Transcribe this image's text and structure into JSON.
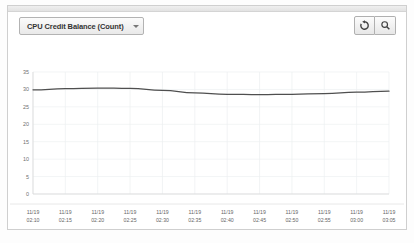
{
  "panel": {
    "metric_selector": {
      "label": "CPU Credit Balance (Count)",
      "caret_icon": "chevron-down-icon"
    },
    "buttons": [
      {
        "name": "refresh-button",
        "icon": "refresh-icon",
        "title": "Refresh"
      },
      {
        "name": "zoom-button",
        "icon": "magnifier-icon",
        "title": "Zoom"
      }
    ]
  },
  "chart_data": {
    "type": "line",
    "title": "CPU Credit Balance (Count)",
    "xlabel": "",
    "ylabel": "",
    "grid": true,
    "legend": "none",
    "ylim": [
      0,
      35
    ],
    "yticks": [
      "0",
      "5",
      "10",
      "15",
      "20",
      "25",
      "30",
      "35"
    ],
    "ytick_values": [
      0,
      5,
      10,
      15,
      20,
      25,
      30,
      35
    ],
    "categories": [
      "11/19\n02:10",
      "11/19\n02:15",
      "11/19\n02:20",
      "11/19\n02:25",
      "11/19\n02:30",
      "11/19\n02:35",
      "11/19\n02:40",
      "11/19\n02:45",
      "11/19\n02:50",
      "11/19\n02:55",
      "11/19\n03:00",
      "11/19\n03:05"
    ],
    "xtick_dates": [
      "11/19",
      "11/19",
      "11/19",
      "11/19",
      "11/19",
      "11/19",
      "11/19",
      "11/19",
      "11/19",
      "11/19",
      "11/19",
      "11/19"
    ],
    "xtick_times": [
      "02:10",
      "02:15",
      "02:20",
      "02:25",
      "02:30",
      "02:35",
      "02:40",
      "02:45",
      "02:50",
      "02:55",
      "03:00",
      "03:05"
    ],
    "series": [
      {
        "name": "CPU Credit Balance",
        "color": "#4f4f4f",
        "values": [
          29.9,
          30.2,
          30.4,
          30.3,
          29.7,
          29.0,
          28.6,
          28.5,
          28.6,
          28.8,
          29.2,
          29.5
        ]
      }
    ]
  }
}
